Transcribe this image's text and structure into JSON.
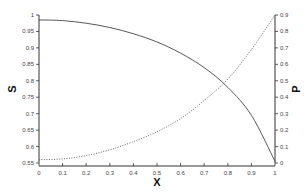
{
  "chart_data": {
    "type": "line",
    "title": "",
    "xlabel": "X",
    "ylabel": "S",
    "y2label": "P",
    "xlim": [
      0,
      1
    ],
    "ylim": [
      0.55,
      1
    ],
    "y2lim": [
      0,
      0.9
    ],
    "grid": false,
    "legend": "none",
    "x_ticks": [
      "0",
      "0.1",
      "0.2",
      "0.3",
      "0.4",
      "0.5",
      "0.6",
      "0.7",
      "0.8",
      "0.9",
      "1"
    ],
    "y_ticks": [
      "0.55",
      "0.6",
      "0.65",
      "0.7",
      "0.75",
      "0.8",
      "0.85",
      "0.9",
      "0.95",
      "1"
    ],
    "y2_ticks": [
      "0",
      "0.1",
      "0.2",
      "0.3",
      "0.4",
      "0.5",
      "0.6",
      "0.7",
      "0.8",
      "0.9"
    ],
    "x": [
      0,
      0.1,
      0.2,
      0.3,
      0.4,
      0.5,
      0.6,
      0.7,
      0.8,
      0.9,
      1.0
    ],
    "series": [
      {
        "name": "S",
        "axis": "left",
        "style": "solid",
        "color": "#444444",
        "values": [
          0.985,
          0.983,
          0.975,
          0.962,
          0.943,
          0.918,
          0.884,
          0.84,
          0.78,
          0.695,
          0.555
        ]
      },
      {
        "name": "P",
        "axis": "right",
        "style": "dotted",
        "color": "#555555",
        "values": [
          0.02,
          0.025,
          0.045,
          0.08,
          0.13,
          0.19,
          0.27,
          0.38,
          0.51,
          0.69,
          0.9
        ]
      }
    ]
  }
}
